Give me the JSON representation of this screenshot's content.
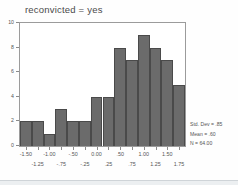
{
  "chart_data": {
    "type": "bar",
    "title": "reconvicted =  yes",
    "xlabel": "",
    "ylabel": "",
    "categories": [
      "-1.50",
      "-1.25",
      "-1.00",
      "-.75",
      "-.50",
      "-.25",
      "0.00",
      ".25",
      ".50",
      ".75",
      "1.00",
      "1.25",
      "1.50",
      "1.75"
    ],
    "values": [
      2,
      2,
      1,
      3,
      2,
      2,
      4,
      4,
      8,
      7,
      9,
      8,
      7,
      5
    ],
    "bin_width": 0.25,
    "bin_starts": [
      -1.625,
      -1.375,
      -1.125,
      -0.875,
      -0.625,
      -0.375,
      -0.125,
      0.125,
      0.375,
      0.625,
      0.875,
      1.125,
      1.375,
      1.625
    ],
    "xlim": [
      -1.625,
      1.875
    ],
    "ylim": [
      0,
      10
    ],
    "grid": false,
    "legend": "none",
    "bar_color": "#6b6b6b",
    "bar_edge_color": "#4a4a4a",
    "frame_color": "#9b9b9b",
    "y_ticks": [
      0,
      2,
      4,
      6,
      8,
      10
    ],
    "y_tick_labels": [
      "0",
      "2",
      "4",
      "6",
      "8",
      "10"
    ],
    "x_ticks_major": [
      -1.5,
      -1.0,
      -0.5,
      0.0,
      0.5,
      1.0,
      1.5
    ],
    "x_tick_labels_major": [
      "-1.50",
      "-1.00",
      "-.50",
      "0.00",
      ".50",
      "1.00",
      "1.50"
    ],
    "x_ticks_minor": [
      -1.25,
      -0.75,
      -0.25,
      0.25,
      0.75,
      1.25,
      1.75
    ],
    "x_tick_labels_minor": [
      "-1.25",
      "-.75",
      "-.25",
      ".25",
      ".75",
      "1.25",
      "1.75"
    ],
    "annotations": {
      "std_dev": "Std. Dev = .85",
      "mean": "Mean = .60",
      "n": "N = 64.00"
    }
  }
}
